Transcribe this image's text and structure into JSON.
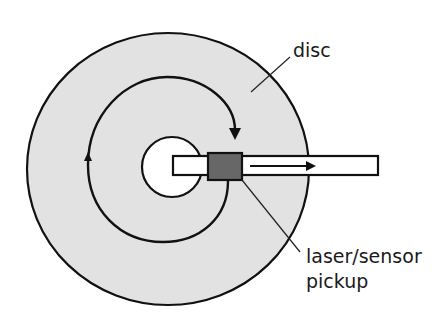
{
  "diagram": {
    "type": "optical disc reading mechanism",
    "labels": {
      "disc": "disc",
      "pickup_line1": "laser/sensor",
      "pickup_line2": "pickup"
    },
    "colors": {
      "disc_fill": "#e2e2e2",
      "outline": "#111111",
      "pickup_fill": "#676767",
      "arm_fill": "#ffffff",
      "hole_fill": "#ffffff",
      "background": "#ffffff"
    },
    "annotations": {
      "spiral_arrow": "rotation / reading direction along spiral track",
      "arm_arrow": "pickup moves outward along arm"
    }
  }
}
